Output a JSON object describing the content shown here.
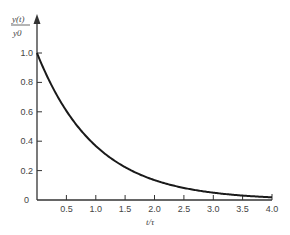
{
  "chart_data": {
    "type": "line",
    "title": "",
    "xlabel": "t/τ",
    "ylabel_numerator": "y(t)",
    "ylabel_denominator": "y0",
    "xlim": [
      0,
      4.0
    ],
    "ylim": [
      0,
      1.0
    ],
    "grid": false,
    "x_ticks": [
      "0.5",
      "1.0",
      "1.5",
      "2.0",
      "2.5",
      "3.0",
      "3.5",
      "4.0"
    ],
    "y_ticks": [
      "0",
      "0.2",
      "0.4",
      "0.6",
      "0.8",
      "1.0"
    ],
    "series": [
      {
        "name": "y(t)/y0 = exp(-t/τ)",
        "x": [
          0,
          0.5,
          1.0,
          1.5,
          2.0,
          2.5,
          3.0,
          3.5,
          4.0
        ],
        "values": [
          1.0,
          0.61,
          0.37,
          0.22,
          0.14,
          0.08,
          0.05,
          0.03,
          0.02
        ]
      }
    ],
    "colors": {
      "curve": "#1a1a1a",
      "axis": "#333333",
      "text": "#444444"
    }
  }
}
